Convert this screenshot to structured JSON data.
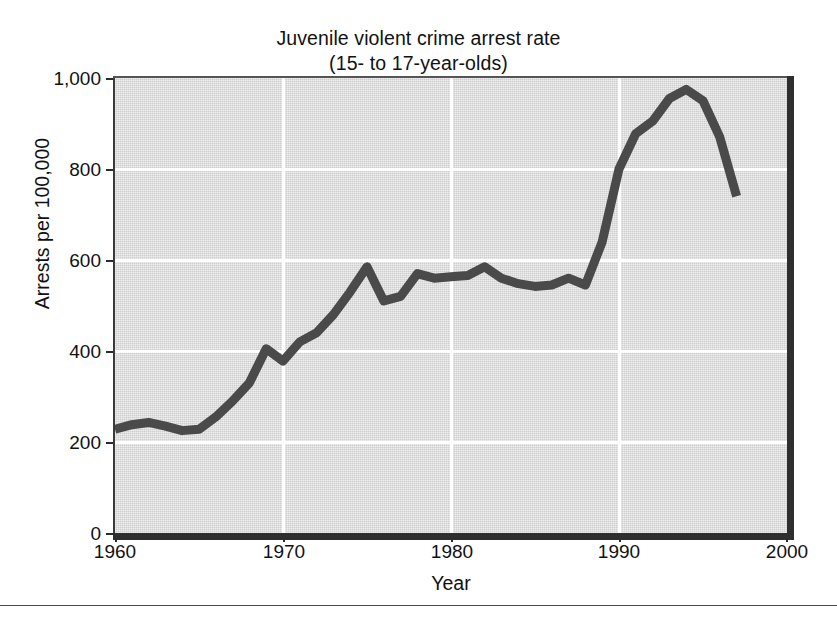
{
  "chart_data": {
    "type": "line",
    "title": "Juvenile violent crime arrest rate",
    "subtitle": "(15- to 17-year-olds)",
    "xlabel": "Year",
    "ylabel": "Arrests per 100,000",
    "xlim": [
      1960,
      2000
    ],
    "ylim": [
      0,
      1000
    ],
    "xticks": [
      1960,
      1970,
      1980,
      1990,
      2000
    ],
    "xtick_labels": [
      "1960",
      "1970",
      "1980",
      "1990",
      "2000"
    ],
    "yticks": [
      0,
      200,
      400,
      600,
      800,
      1000
    ],
    "ytick_labels": [
      "0",
      "200",
      "400",
      "600",
      "800",
      "1,000"
    ],
    "grid": "white gridlines at y=200,400,600,800 and x=1970,1980,1990",
    "legend": "none",
    "line_color": "#4a4a4a",
    "plot_background": "#cfcfcf",
    "series": [
      {
        "name": "Juvenile violent crime arrest rate (15- to 17-year-olds)",
        "x": [
          1960,
          1961,
          1962,
          1963,
          1964,
          1965,
          1966,
          1967,
          1968,
          1969,
          1970,
          1971,
          1972,
          1973,
          1974,
          1975,
          1976,
          1977,
          1978,
          1979,
          1980,
          1981,
          1982,
          1983,
          1984,
          1985,
          1986,
          1987,
          1988,
          1989,
          1990,
          1991,
          1992,
          1993,
          1994,
          1995,
          1996,
          1997
        ],
        "values": [
          228,
          238,
          243,
          235,
          225,
          228,
          255,
          290,
          330,
          405,
          378,
          420,
          440,
          480,
          530,
          585,
          510,
          520,
          570,
          560,
          563,
          566,
          585,
          560,
          548,
          542,
          545,
          560,
          545,
          640,
          800,
          878,
          905,
          955,
          975,
          950,
          870,
          740
        ]
      }
    ]
  }
}
